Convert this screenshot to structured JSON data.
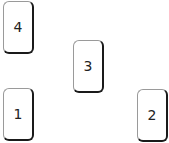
{
  "cards": [
    {
      "label": "4",
      "x": 3,
      "y": 1
    },
    {
      "label": "3",
      "x": 73,
      "y": 40
    },
    {
      "label": "1",
      "x": 3,
      "y": 88
    },
    {
      "label": "2",
      "x": 137,
      "y": 89
    }
  ],
  "colors": {
    "background": "#ffffff",
    "card_fill": "#ffffff",
    "card_border_light": "#9a9a9a",
    "card_border_dark": "#1a1a1a",
    "text": "#222222"
  }
}
